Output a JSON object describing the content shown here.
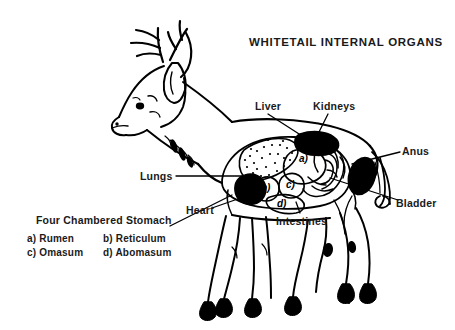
{
  "title": "WHITETAIL INTERNAL ORGANS",
  "labels": {
    "liver": "Liver",
    "kidneys": "Kidneys",
    "anus": "Anus",
    "bladder": "Bladder",
    "lungs": "Lungs",
    "heart": "Heart",
    "intestines": "Intestines"
  },
  "stomach_legend": {
    "title": "Four Chambered Stomach",
    "items": [
      {
        "key": "a)",
        "name": "Rumen"
      },
      {
        "key": "b)",
        "name": "Reticulum"
      },
      {
        "key": "c)",
        "name": "Omasum"
      },
      {
        "key": "d)",
        "name": "Abomasum"
      }
    ],
    "rows": [
      {
        "left": "a) Rumen",
        "right": "b) Reticulum"
      },
      {
        "left": "c) Omasum",
        "right": "d) Abomasum"
      }
    ]
  },
  "diagram": {
    "chamber_markers": [
      "a)",
      "b)",
      "c)",
      "d)"
    ],
    "colors": {
      "ink": "#000000",
      "text": "#1a1a1a",
      "background": "#ffffff"
    }
  }
}
